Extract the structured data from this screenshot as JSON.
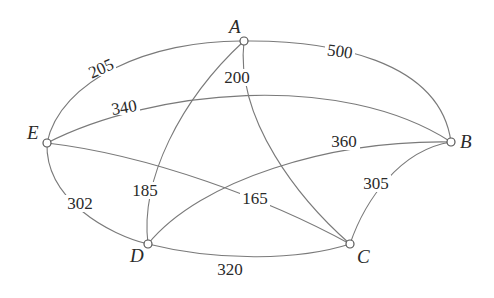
{
  "diagram": {
    "type": "weighted-graph",
    "nodes": [
      {
        "id": "A",
        "label": "A"
      },
      {
        "id": "B",
        "label": "B"
      },
      {
        "id": "C",
        "label": "C"
      },
      {
        "id": "D",
        "label": "D"
      },
      {
        "id": "E",
        "label": "E"
      }
    ],
    "edges": [
      {
        "from": "A",
        "to": "E",
        "weight": "205"
      },
      {
        "from": "A",
        "to": "B",
        "weight": "500"
      },
      {
        "from": "A",
        "to": "C",
        "weight": "200"
      },
      {
        "from": "A",
        "to": "D",
        "weight": "185"
      },
      {
        "from": "E",
        "to": "B",
        "weight": "340"
      },
      {
        "from": "E",
        "to": "C",
        "weight": "165"
      },
      {
        "from": "E",
        "to": "D",
        "weight": "302"
      },
      {
        "from": "D",
        "to": "B",
        "weight": "360"
      },
      {
        "from": "D",
        "to": "C",
        "weight": "320"
      },
      {
        "from": "B",
        "to": "C",
        "weight": "305"
      }
    ]
  }
}
